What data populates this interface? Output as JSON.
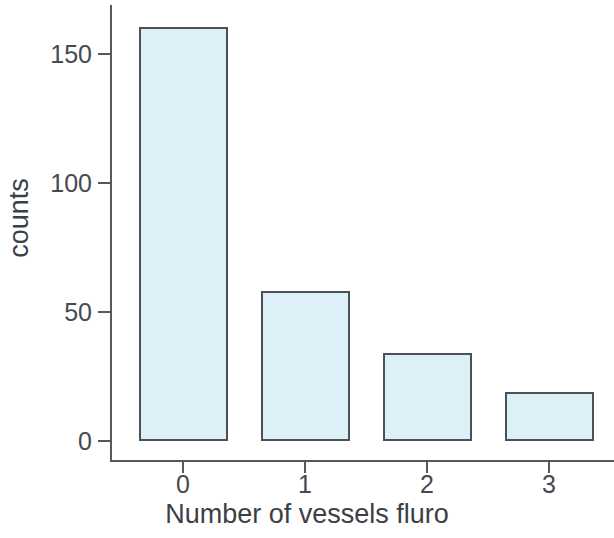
{
  "chart_data": {
    "type": "bar",
    "title": "",
    "subtitle": "",
    "xlabel": "Number of vessels fluro",
    "ylabel": "counts",
    "categories": [
      "0",
      "1",
      "2",
      "3"
    ],
    "values": [
      160,
      58,
      34,
      19
    ],
    "series": [
      {
        "name": "counts",
        "values": [
          160,
          58,
          34,
          19
        ]
      }
    ],
    "x_tick_labels": [
      "0",
      "1",
      "2",
      "3"
    ],
    "y_tick_labels": [
      "0",
      "50",
      "100",
      "150"
    ],
    "y_ticks": [
      0,
      50,
      100,
      150
    ],
    "ylim": [
      0,
      168
    ],
    "xlim": [
      -0.5,
      3.5
    ],
    "grid": false,
    "legend": false,
    "legend_position": "none",
    "annotations": [],
    "style": {
      "bar_fill": "#ddeff7",
      "bar_border": "#4b5157",
      "axis_color": "#55595e",
      "text_color": "#3c4045",
      "background": "#ffffff"
    }
  }
}
